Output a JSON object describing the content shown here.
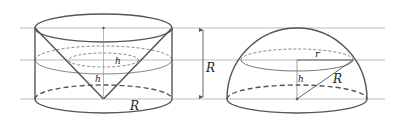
{
  "diagram": {
    "colors": {
      "stroke": "#555555",
      "guide": "#aaaaaa",
      "text": "#222222",
      "background": "#ffffff"
    },
    "cylinder_figure": {
      "labels": {
        "h_upper": "h",
        "h_lower": "h",
        "radius": "R"
      }
    },
    "height_marker": {
      "label": "R"
    },
    "hemisphere_figure": {
      "labels": {
        "section_radius": "r",
        "height": "h",
        "slant_radius": "R"
      }
    }
  }
}
